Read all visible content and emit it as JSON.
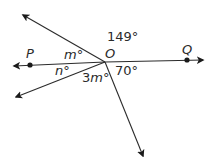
{
  "diagram": {
    "vertex": {
      "label": "O",
      "x": 105,
      "y": 62
    },
    "points": [
      {
        "name": "P",
        "label": "P",
        "x": 30,
        "y": 65
      },
      {
        "name": "Q",
        "label": "Q",
        "x": 187,
        "y": 60
      }
    ],
    "rays": [
      {
        "name": "ray-op",
        "tip_x": 14,
        "tip_y": 66
      },
      {
        "name": "ray-oq",
        "tip_x": 203,
        "tip_y": 60
      },
      {
        "name": "ray-upper-left",
        "tip_x": 23,
        "tip_y": 15
      },
      {
        "name": "ray-lower-left",
        "tip_x": 16,
        "tip_y": 97
      },
      {
        "name": "ray-down",
        "tip_x": 143,
        "tip_y": 156
      }
    ],
    "angles": [
      {
        "name": "angle-149",
        "label": "149°"
      },
      {
        "name": "angle-m",
        "var": "m",
        "deg": "°"
      },
      {
        "name": "angle-n",
        "var": "n",
        "deg": "°"
      },
      {
        "name": "angle-3m",
        "coef": "3",
        "var": "m",
        "deg": "°"
      },
      {
        "name": "angle-70",
        "label": "70°"
      }
    ],
    "colors": {
      "line": "#2b2b2b",
      "background": "#ffffff"
    }
  }
}
